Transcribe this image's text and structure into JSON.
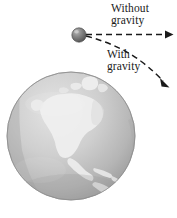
{
  "figure": {
    "background_color": "#ffffff"
  },
  "labels": {
    "without_gravity": {
      "line1": "Without",
      "line2": "gravity"
    },
    "with_gravity": {
      "line1": "With",
      "line2": "gravity"
    }
  },
  "elements": {
    "projectile_name": "projectile-ball",
    "earth_name": "earth-globe",
    "straight_path_name": "without-gravity-path-arrow",
    "curved_path_name": "with-gravity-path-arrow"
  },
  "colors": {
    "ink": "#1a1a1a",
    "ball_dark": "#595959",
    "ball_light": "#b9b9b9",
    "ocean_dark": "#9d9d9d",
    "ocean_light": "#d6d6d6",
    "land": "#eeeeee",
    "globe_edge": "#8a8a8a"
  },
  "geometry": {
    "ball_center_x": 79,
    "ball_center_y": 35,
    "ball_radius": 7,
    "globe_center_x": 71,
    "globe_center_y": 136,
    "globe_radius": 64,
    "straight_arrow_end_x": 173,
    "straight_arrow_end_y": 34,
    "curved_arrow_end_x": 168,
    "curved_arrow_end_y": 86
  }
}
